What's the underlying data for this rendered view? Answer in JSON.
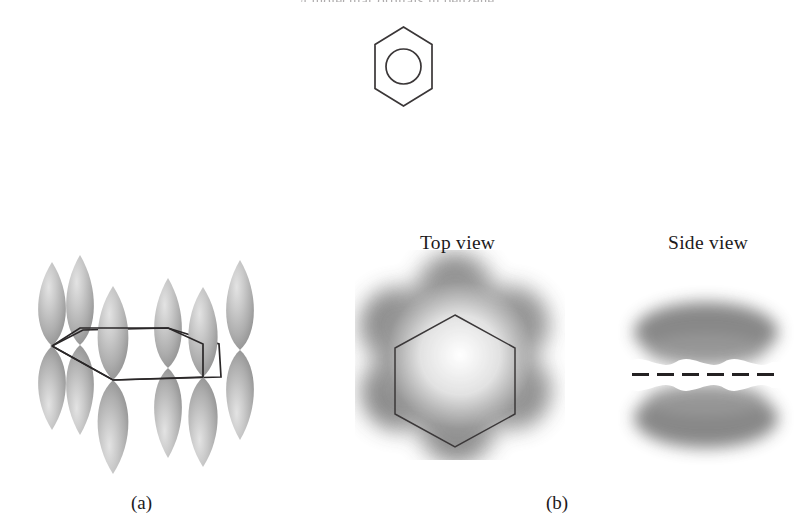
{
  "figure": {
    "cut_header_text": "π molecular orbitals in benzene",
    "panels": [
      {
        "id": "a",
        "caption": "(a)",
        "description": "six 2p orbitals on the benzene ring carbons"
      },
      {
        "id": "b",
        "caption": "(b)",
        "description": "delocalized pi electron cloud"
      }
    ],
    "view_labels": {
      "top": "Top view",
      "side": "Side view"
    },
    "molecule_symbol": {
      "name": "benzene-ring-symbol",
      "ring_sides": 6,
      "inscribed_circle": true
    },
    "orbitals": {
      "count": 6,
      "shape": "p-orbital dumbbell",
      "ring_sides": 6
    },
    "side_view": {
      "lobes": 2,
      "nodal_plane_style": "dashed",
      "dash_count": 7
    },
    "colors": {
      "orbital_light": "#d5d5d5",
      "orbital_mid": "#ababab",
      "orbital_dark": "#8d8d8d",
      "cloud": "#7a7a7a",
      "line": "#2f2c2d",
      "text": "#1d1a1b",
      "background": "#ffffff"
    }
  }
}
